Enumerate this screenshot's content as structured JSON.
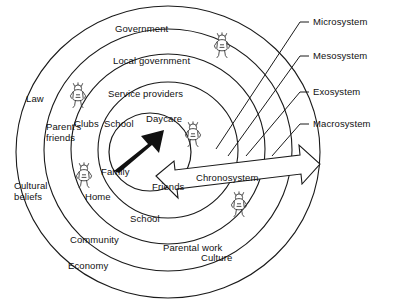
{
  "diagram": {
    "type": "concentric-circles",
    "background_color": "#ffffff",
    "line_color": "#1a1a1a",
    "arrow_color": "#111111"
  },
  "system_labels": [
    {
      "id": "microsystem",
      "text": "Microsystem"
    },
    {
      "id": "mesosystem",
      "text": "Mesosystem"
    },
    {
      "id": "exosystem",
      "text": "Exosystem"
    },
    {
      "id": "macrosystem",
      "text": "Macrosystem"
    }
  ],
  "ring_labels": {
    "macrosystem": [
      {
        "id": "law",
        "text": "Law"
      },
      {
        "id": "cultural-beliefs",
        "text": "Cultural\nbeliefs"
      },
      {
        "id": "economy",
        "text": "Economy"
      },
      {
        "id": "culture",
        "text": "Culture"
      }
    ],
    "exosystem": [
      {
        "id": "government",
        "text": "Government"
      },
      {
        "id": "parents-friends",
        "text": "Parent's\nfriends"
      },
      {
        "id": "community",
        "text": "Community"
      },
      {
        "id": "parental-work",
        "text": "Parental work"
      }
    ],
    "mesosystem": [
      {
        "id": "local-government",
        "text": "Local government"
      },
      {
        "id": "clubs",
        "text": "Clubs"
      },
      {
        "id": "school-outer",
        "text": "School"
      },
      {
        "id": "school-lower",
        "text": "School"
      }
    ],
    "microsystem": [
      {
        "id": "service-providers",
        "text": "Service providers"
      },
      {
        "id": "family",
        "text": "Family"
      },
      {
        "id": "home",
        "text": "Home"
      },
      {
        "id": "daycare",
        "text": "Daycare"
      },
      {
        "id": "friends",
        "text": "Friends"
      }
    ]
  },
  "chronosystem": {
    "label": "Chronosystem",
    "shape": "double-headed-block-arrow"
  },
  "center_arrow": {
    "id": "child-development-arrow",
    "direction": "up-right",
    "color": "#111111"
  },
  "child_figures": [
    {
      "id": "child-figure-top",
      "ring": "exosystem"
    },
    {
      "id": "child-figure-left-upper",
      "ring": "exosystem"
    },
    {
      "id": "child-figure-left-lower",
      "ring": "mesosystem"
    },
    {
      "id": "child-figure-center",
      "ring": "microsystem"
    },
    {
      "id": "child-figure-lower-right",
      "ring": "chronosystem"
    }
  ]
}
